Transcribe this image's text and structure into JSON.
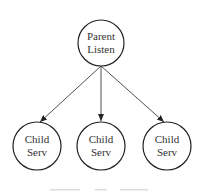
{
  "diagram": {
    "type": "tree",
    "colors": {
      "stroke": "#222222",
      "text": "#333333",
      "background": "#ffffff"
    },
    "nodes": [
      {
        "id": "parent",
        "line1": "Parent",
        "line2": "Listen",
        "cx": 101,
        "cy": 43,
        "r": 23
      },
      {
        "id": "child1",
        "line1": "Child",
        "line2": "Serv",
        "cx": 37,
        "cy": 146,
        "r": 24
      },
      {
        "id": "child2",
        "line1": "Child",
        "line2": "Serv",
        "cx": 101,
        "cy": 146,
        "r": 24
      },
      {
        "id": "child3",
        "line1": "Child",
        "line2": "Serv",
        "cx": 167,
        "cy": 146,
        "r": 24
      }
    ],
    "edges": [
      {
        "from": "parent",
        "to": "child1"
      },
      {
        "from": "parent",
        "to": "child2"
      },
      {
        "from": "parent",
        "to": "child3"
      }
    ]
  }
}
